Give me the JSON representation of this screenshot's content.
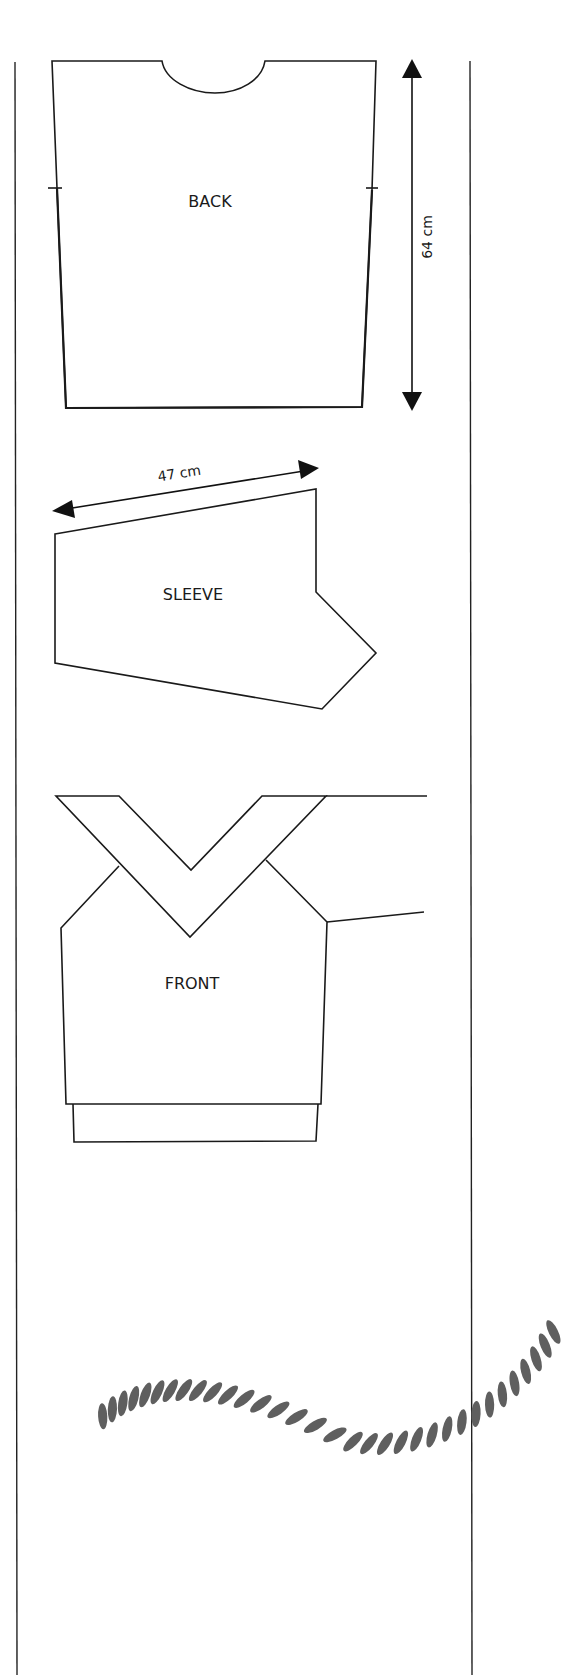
{
  "diagram": {
    "type": "knitting-schematic",
    "pieces": {
      "back": {
        "label": "BACK"
      },
      "sleeve": {
        "label": "SLEEVE"
      },
      "front": {
        "label": "FRONT"
      }
    },
    "measurements": {
      "back_length": "64 cm",
      "sleeve_length": "47 cm"
    },
    "decoration": {
      "name": "rope-ornament",
      "color": "#5f5f5f"
    },
    "colors": {
      "outline": "#1a1a1a",
      "background": "#ffffff"
    }
  }
}
